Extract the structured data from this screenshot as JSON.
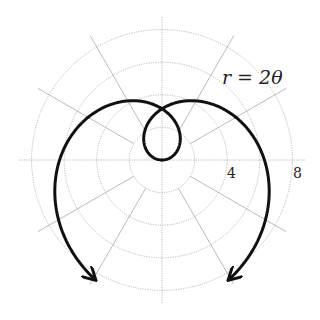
{
  "chart_data": {
    "type": "line",
    "subtype": "polar",
    "title": "",
    "equation": "r = 2θ",
    "theta_range": [
      -4.2,
      4.2
    ],
    "r_ticks": [
      2,
      4,
      6,
      8
    ],
    "r_tick_labels": [
      "4",
      "8"
    ],
    "angular_grid_step_deg": 30,
    "grid": true,
    "series": [
      {
        "name": "r = 2θ",
        "color": "#111111",
        "arrows_at_ends": true,
        "sample_points": [
          {
            "theta": 0,
            "r": 0
          },
          {
            "theta": 1.5708,
            "r": 3.14
          },
          {
            "theta": 3.1416,
            "r": 6.28
          },
          {
            "theta": 4.2,
            "r": 8.4
          },
          {
            "theta": -1.5708,
            "r": -3.14
          },
          {
            "theta": -3.1416,
            "r": -6.28
          },
          {
            "theta": -4.2,
            "r": -8.4
          }
        ]
      }
    ]
  },
  "labels": {
    "equation": "r = 2θ",
    "tick_4": "4",
    "tick_8": "8"
  }
}
